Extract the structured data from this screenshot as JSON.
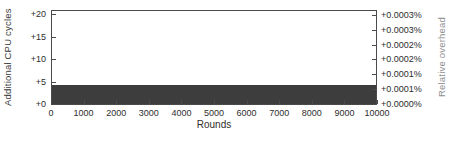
{
  "chart_data": {
    "type": "area",
    "title": "",
    "xlabel": "Rounds",
    "ylabel_left": "Additional CPU cycles",
    "ylabel_right": "Relative overhead",
    "x_tick_labels": [
      "0",
      "1000",
      "2000",
      "3000",
      "4000",
      "5000",
      "6000",
      "7000",
      "8000",
      "9000",
      "10000"
    ],
    "x_tick_values": [
      0,
      1000,
      2000,
      3000,
      4000,
      5000,
      6000,
      7000,
      8000,
      9000,
      10000
    ],
    "xlim": [
      0,
      10000
    ],
    "left_tick_labels": [
      "+0",
      "+5",
      "+10",
      "+15",
      "+20"
    ],
    "left_tick_values": [
      0,
      5,
      10,
      15,
      20
    ],
    "ylim_left": [
      0,
      21.3
    ],
    "right_tick_labels": [
      "+0.0000%",
      "+0.0001%",
      "+0.0001%",
      "+0.0002%",
      "+0.0002%",
      "+0.0003%",
      "+0.0003%"
    ],
    "right_tick_values": [
      0.0,
      5e-05,
      0.0001,
      0.00015,
      0.0002,
      0.00025,
      0.0003
    ],
    "ylim_right": [
      0,
      0.00032
    ],
    "grid": false,
    "legend": "none",
    "series": [
      {
        "name": "additional-cpu-cycles-overhead",
        "x": [
          0,
          10000
        ],
        "y_cycles": [
          4,
          4
        ],
        "y_relative_overhead_pct": [
          6e-05,
          6e-05
        ],
        "style": "constant filled band from 0 to value"
      }
    ],
    "colors": {
      "band": "#3d3d3d",
      "frame": "#4a4a4a",
      "tick_text": "#2e2e2e",
      "left_axis_title": "#3a3a3a",
      "right_axis_title": "#8f8f8f",
      "background": "#ffffff"
    }
  }
}
